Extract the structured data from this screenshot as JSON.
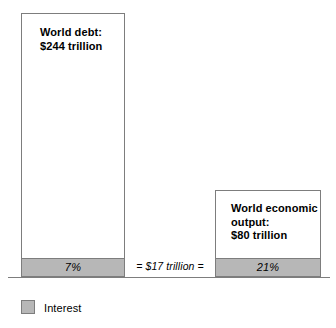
{
  "chart_data": {
    "type": "bar",
    "title": "",
    "subtitle": "",
    "xlabel": "",
    "ylabel": "",
    "grid": false,
    "legend_position": "bottom-left",
    "categories": [
      "World debt",
      "World economic output"
    ],
    "series": [
      {
        "name": "Total",
        "units": "trillion USD",
        "values": [
          244,
          80
        ]
      },
      {
        "name": "Interest",
        "units": "trillion USD",
        "values": [
          17,
          17
        ]
      }
    ],
    "interest_percent_of_total": [
      7,
      21
    ],
    "annotations": [
      {
        "name": "connector",
        "text": "= $17 trillion =",
        "style": "italic",
        "position": "between-bars-baseline"
      }
    ],
    "bars": [
      {
        "id": "world-debt",
        "label": "World debt:\n$244 trillion",
        "total_value": 244,
        "interest_value": 17,
        "interest_percent_label": "7%"
      },
      {
        "id": "world-economic-output",
        "label": "World economic\noutput:\n$80 trillion",
        "total_value": 80,
        "interest_value": 17,
        "interest_percent_label": "21%"
      }
    ],
    "colors": {
      "bar_fill": "#ffffff",
      "bar_border": "#7d7d7d",
      "interest_fill": "#b7b7b7",
      "baseline": "#7d7d7d",
      "text": "#000000"
    }
  },
  "bars": {
    "world_debt": {
      "label": "World debt:\n$244 trillion",
      "interest_percent": "7%"
    },
    "world_output": {
      "label": "World economic\noutput:\n$80 trillion",
      "interest_percent": "21%"
    }
  },
  "connector": {
    "text": "= $17 trillion ="
  },
  "legend": {
    "items": [
      {
        "label": "Interest",
        "color": "#b7b7b7"
      }
    ],
    "interest_label": "Interest"
  }
}
